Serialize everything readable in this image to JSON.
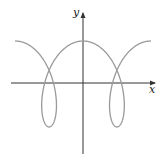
{
  "chart_data": {
    "type": "line",
    "title": "",
    "xlabel": "x",
    "ylabel": "y",
    "grid": false,
    "legend": null,
    "curve": {
      "kind": "parametric",
      "description": "Prolate trochoid-like curve x = t + a·sin t, y = cos t with loops below the x-axis",
      "a": 2,
      "t_range": [
        -6.283,
        6.283
      ],
      "color": "#9a9a9a",
      "stroke_width": 1.3
    },
    "axes": {
      "color": "#333333",
      "origin_px": [
        83,
        83
      ],
      "x_extent_px": [
        11,
        155
      ],
      "y_extent_px": [
        13,
        154
      ],
      "x_scale_px_per_unit": 10.8,
      "y_scale_px_per_unit": 43,
      "y_center_px": 84
    },
    "features": {
      "peaks": [
        [
          -6.283,
          1
        ],
        [
          0,
          1
        ],
        [
          6.283,
          1
        ]
      ],
      "loop_bottoms": [
        [
          -3.1416,
          -1
        ],
        [
          3.1416,
          -1
        ]
      ],
      "self_intersections_y": 0.33
    }
  },
  "labels": {
    "x_axis": "x",
    "y_axis": "y"
  }
}
